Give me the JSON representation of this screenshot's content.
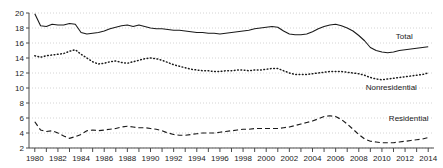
{
  "chart_data": {
    "type": "line",
    "title": "",
    "subtitle": "",
    "xlabel": "",
    "ylabel": "",
    "xlim": [
      1979.5,
      2014.5
    ],
    "ylim": [
      2,
      20
    ],
    "grid": true,
    "legend_position": "right-inline",
    "y_ticks": [
      2,
      4,
      6,
      8,
      10,
      12,
      14,
      16,
      18,
      20
    ],
    "x_ticks": [
      1980,
      1981,
      1982,
      1983,
      1984,
      1985,
      1986,
      1987,
      1988,
      1989,
      1990,
      1991,
      1992,
      1993,
      1994,
      1995,
      1996,
      1997,
      1998,
      1999,
      2000,
      2001,
      2002,
      2003,
      2004,
      2005,
      2006,
      2007,
      2008,
      2009,
      2010,
      2011,
      2012,
      2013,
      2014
    ],
    "x_tick_labels": [
      "1980",
      "",
      "1982",
      "",
      "1984",
      "",
      "1986",
      "",
      "1988",
      "",
      "1990",
      "",
      "1992",
      "",
      "1994",
      "",
      "1996",
      "",
      "1998",
      "",
      "2000",
      "",
      "2002",
      "",
      "2004",
      "",
      "2006",
      "",
      "2008",
      "",
      "2010",
      "",
      "2012",
      "",
      "2014"
    ],
    "x": [
      1980,
      1980.5,
      1981,
      1981.5,
      1982,
      1982.5,
      1983,
      1983.5,
      1984,
      1984.5,
      1985,
      1985.5,
      1986,
      1986.5,
      1987,
      1987.5,
      1988,
      1988.5,
      1989,
      1989.5,
      1990,
      1990.5,
      1991,
      1991.5,
      1992,
      1992.5,
      1993,
      1993.5,
      1994,
      1994.5,
      1995,
      1995.5,
      1996,
      1996.5,
      1997,
      1997.5,
      1998,
      1998.5,
      1999,
      1999.5,
      2000,
      2000.5,
      2001,
      2001.5,
      2002,
      2002.5,
      2003,
      2003.5,
      2004,
      2004.5,
      2005,
      2005.5,
      2006,
      2006.5,
      2007,
      2007.5,
      2008,
      2008.5,
      2009,
      2009.5,
      2010,
      2010.5,
      2011,
      2011.5,
      2012,
      2012.5,
      2013,
      2013.5,
      2014
    ],
    "series": [
      {
        "name": "Total",
        "style": "solid",
        "values": [
          19.9,
          18.3,
          18.2,
          18.5,
          18.4,
          18.4,
          18.6,
          18.5,
          17.4,
          17.2,
          17.3,
          17.4,
          17.6,
          17.9,
          18.1,
          18.3,
          18.4,
          18.2,
          18.4,
          18.2,
          18.0,
          17.9,
          17.9,
          17.8,
          17.7,
          17.7,
          17.6,
          17.5,
          17.4,
          17.4,
          17.3,
          17.3,
          17.2,
          17.3,
          17.4,
          17.5,
          17.6,
          17.7,
          17.9,
          18.0,
          18.1,
          18.2,
          18.1,
          17.6,
          17.2,
          17.1,
          17.1,
          17.2,
          17.5,
          17.9,
          18.2,
          18.4,
          18.5,
          18.3,
          18.0,
          17.6,
          17.0,
          16.3,
          15.4,
          15.0,
          14.8,
          14.7,
          14.8,
          15.0,
          15.1,
          15.2,
          15.3,
          15.4,
          15.5
        ]
      },
      {
        "name": "Nonresidential",
        "style": "dotted",
        "values": [
          14.3,
          14.1,
          14.3,
          14.4,
          14.5,
          14.6,
          14.9,
          15.1,
          14.5,
          14.0,
          13.5,
          13.2,
          13.3,
          13.5,
          13.6,
          13.4,
          13.3,
          13.5,
          13.7,
          13.9,
          14.0,
          13.9,
          13.7,
          13.4,
          13.1,
          12.9,
          12.7,
          12.5,
          12.4,
          12.3,
          12.3,
          12.2,
          12.2,
          12.3,
          12.3,
          12.4,
          12.4,
          12.3,
          12.4,
          12.4,
          12.5,
          12.6,
          12.6,
          12.3,
          12.0,
          11.8,
          11.8,
          11.8,
          11.9,
          12.0,
          12.1,
          12.2,
          12.2,
          12.2,
          12.1,
          12.0,
          11.9,
          11.7,
          11.4,
          11.2,
          11.1,
          11.2,
          11.3,
          11.4,
          11.5,
          11.6,
          11.7,
          11.8,
          12.0
        ]
      },
      {
        "name": "Residential",
        "style": "dashed",
        "values": [
          5.5,
          4.4,
          4.2,
          4.3,
          4.0,
          3.6,
          3.3,
          3.5,
          3.8,
          4.3,
          4.4,
          4.3,
          4.4,
          4.5,
          4.6,
          4.8,
          4.9,
          4.8,
          4.7,
          4.7,
          4.6,
          4.5,
          4.3,
          4.0,
          3.8,
          3.7,
          3.7,
          3.8,
          3.9,
          4.0,
          4.0,
          4.0,
          4.1,
          4.2,
          4.3,
          4.4,
          4.5,
          4.5,
          4.6,
          4.6,
          4.6,
          4.6,
          4.6,
          4.7,
          4.8,
          5.0,
          5.2,
          5.4,
          5.6,
          5.9,
          6.2,
          6.3,
          6.2,
          5.8,
          5.2,
          4.5,
          3.8,
          3.2,
          2.9,
          2.8,
          2.7,
          2.7,
          2.7,
          2.8,
          2.9,
          3.0,
          3.1,
          3.2,
          3.4
        ]
      }
    ],
    "annotations": [
      {
        "text": "Total",
        "x": 2011.2,
        "y": 16.6
      },
      {
        "text": "Nonresidential",
        "x": 2008.6,
        "y": 9.7
      },
      {
        "text": "Residential",
        "x": 2010.6,
        "y": 5.6
      }
    ]
  }
}
